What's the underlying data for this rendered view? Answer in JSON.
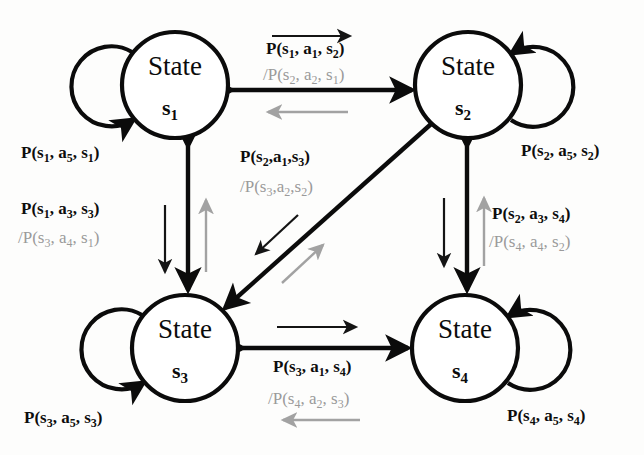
{
  "diagram": {
    "colors": {
      "forward": "#0b0b0b",
      "reverse": "#9a9a9a",
      "background": "#fdfdfc"
    },
    "states": [
      {
        "id": "s1",
        "label": "State",
        "sublabel": "s",
        "subindex": "1",
        "cx": 175,
        "cy": 85,
        "r": 53
      },
      {
        "id": "s2",
        "label": "State",
        "sublabel": "s",
        "subindex": "2",
        "cx": 468,
        "cy": 85,
        "r": 53
      },
      {
        "id": "s3",
        "label": "State",
        "sublabel": "s",
        "subindex": "3",
        "cx": 185,
        "cy": 348,
        "r": 53
      },
      {
        "id": "s4",
        "label": "State",
        "sublabel": "s",
        "subindex": "4",
        "cx": 465,
        "cy": 348,
        "r": 53
      }
    ],
    "self_loops": [
      {
        "id": "loop-s1",
        "state": "s1",
        "side": "left",
        "label": "P(s1, a5, s1)",
        "label_parts": [
          "P(s",
          "1",
          ", a",
          "5",
          ", s",
          "1",
          ")"
        ]
      },
      {
        "id": "loop-s2",
        "state": "s2",
        "side": "right",
        "label": "P(s2, a5, s2)",
        "label_parts": [
          "P(s",
          "2",
          ", a",
          "5",
          ", s",
          "2",
          ")"
        ]
      },
      {
        "id": "loop-s3",
        "state": "s3",
        "side": "left",
        "label": "P(s3, a5, s3)",
        "label_parts": [
          "P(s",
          "3",
          ", a",
          "5",
          ", s",
          "3",
          ")"
        ]
      },
      {
        "id": "loop-s4",
        "state": "s4",
        "side": "right",
        "label": "P(s4, a5, s4)",
        "label_parts": [
          "P(s",
          "4",
          ", a",
          "5",
          ", s",
          "4",
          ")"
        ]
      }
    ],
    "edges": [
      {
        "id": "edge-s1-s2",
        "from": "s1",
        "to": "s2",
        "orientation": "horizontal-top",
        "forward_label": "P(s1, a1, s2)",
        "reverse_label": "/P(s2, a2, s1)"
      },
      {
        "id": "edge-s1-s3",
        "from": "s1",
        "to": "s3",
        "orientation": "vertical-left",
        "forward_label": "P(s1, a3, s3)",
        "reverse_label": "/P(s3, a4, s1)"
      },
      {
        "id": "edge-s2-s4",
        "from": "s2",
        "to": "s4",
        "orientation": "vertical-right",
        "forward_label": "P(s2, a3, s4)",
        "reverse_label": "/P(s4, a4, s2)"
      },
      {
        "id": "edge-s3-s4",
        "from": "s3",
        "to": "s4",
        "orientation": "horizontal-bottom",
        "forward_label": "P(s3, a1, s4)",
        "reverse_label": "/P(s4, a2, s3)"
      },
      {
        "id": "edge-s2-s3",
        "from": "s2",
        "to": "s3",
        "orientation": "diagonal",
        "forward_label": "P(s2,a1,s3)",
        "reverse_label": "/P(s3,a2,s2)"
      }
    ]
  }
}
